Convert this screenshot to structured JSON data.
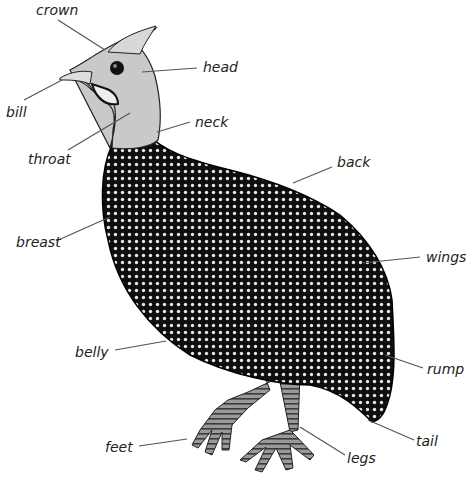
{
  "diagram": {
    "background": "#ffffff",
    "body_color": "#111111",
    "spot_color": "#e8e8e8",
    "head_color": "#c8c8c8",
    "leader_color": "#555555",
    "labels": [
      {
        "id": "crown",
        "text": "crown",
        "x": 36,
        "y": 3,
        "lx1": 58,
        "ly1": 20,
        "lx2": 105,
        "ly2": 50
      },
      {
        "id": "head",
        "text": "head",
        "x": 203,
        "y": 60,
        "lx1": 197,
        "ly1": 68,
        "lx2": 142,
        "ly2": 72
      },
      {
        "id": "bill",
        "text": "bill",
        "x": 6,
        "y": 105,
        "lx1": 24,
        "ly1": 100,
        "lx2": 62,
        "ly2": 80
      },
      {
        "id": "neck",
        "text": "neck",
        "x": 195,
        "y": 115,
        "lx1": 190,
        "ly1": 122,
        "lx2": 157,
        "ly2": 132
      },
      {
        "id": "throat",
        "text": "throat",
        "x": 28,
        "y": 152,
        "lx1": 68,
        "ly1": 150,
        "lx2": 130,
        "ly2": 113
      },
      {
        "id": "back",
        "text": "back",
        "x": 337,
        "y": 155,
        "lx1": 332,
        "ly1": 167,
        "lx2": 293,
        "ly2": 183
      },
      {
        "id": "breast",
        "text": "breast",
        "x": 16,
        "y": 235,
        "lx1": 56,
        "ly1": 241,
        "lx2": 110,
        "ly2": 217
      },
      {
        "id": "wings",
        "text": "wings",
        "x": 426,
        "y": 250,
        "lx1": 420,
        "ly1": 257,
        "lx2": 363,
        "ly2": 263
      },
      {
        "id": "belly",
        "text": "belly",
        "x": 75,
        "y": 345,
        "lx1": 115,
        "ly1": 350,
        "lx2": 166,
        "ly2": 341
      },
      {
        "id": "rump",
        "text": "rump",
        "x": 427,
        "y": 362,
        "lx1": 423,
        "ly1": 368,
        "lx2": 385,
        "ly2": 355
      },
      {
        "id": "feet",
        "text": "feet",
        "x": 105,
        "y": 440,
        "lx1": 139,
        "ly1": 446,
        "lx2": 187,
        "ly2": 439
      },
      {
        "id": "tail",
        "text": "tail",
        "x": 416,
        "y": 434,
        "lx1": 414,
        "ly1": 440,
        "lx2": 368,
        "ly2": 420
      },
      {
        "id": "legs",
        "text": "legs",
        "x": 347,
        "y": 451,
        "lx1": 345,
        "ly1": 455,
        "lx2": 300,
        "ly2": 427
      }
    ]
  }
}
